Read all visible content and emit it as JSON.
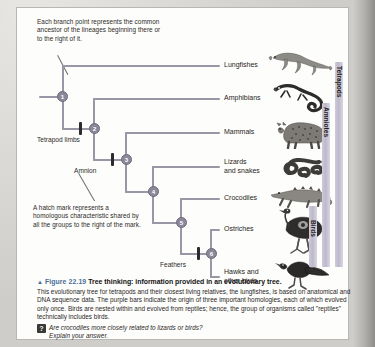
{
  "figure": {
    "triangle_icon": "▲",
    "number": "Figure 22.19",
    "title": "Tree thinking: information provided in an evolutionary tree.",
    "body": "This evolutionary tree for tetrapods and their closest living relatives, the lungfishes, is based on anatomical and DNA sequence data. The purple bars indicate the origin of three important homologies, each of which evolved only once. Birds are nested within and evolved from reptiles; hence, the group of organisms called \"reptiles\" technically includes birds.",
    "question_icon": "?",
    "question": "Are crocodiles more closely related to lizards or birds?\nExplain your answer."
  },
  "annotations": [
    {
      "name": "branch-point-note",
      "text": "Each branch point represents the common ancestor of the lineages beginning there or to the right of it."
    },
    {
      "name": "hatch-mark-note",
      "text": "A hatch mark represents a homologous characteristic shared by all the groups to the right of the mark."
    }
  ],
  "tree": {
    "nodes": [
      {
        "id": "1",
        "label": "1"
      },
      {
        "id": "2",
        "label": "2"
      },
      {
        "id": "3",
        "label": "3"
      },
      {
        "id": "4",
        "label": "4"
      },
      {
        "id": "5",
        "label": "5"
      },
      {
        "id": "6",
        "label": "6"
      }
    ],
    "hatch_marks": [
      {
        "id": "tetrapod-limbs",
        "label": "Tetrapod limbs"
      },
      {
        "id": "amnion",
        "label": "Amnion"
      },
      {
        "id": "feathers",
        "label": "Feathers"
      }
    ],
    "taxa": [
      {
        "id": "lungfishes",
        "label": "Lungfishes",
        "animal": "lungfish-illustration"
      },
      {
        "id": "amphibians",
        "label": "Amphibians",
        "animal": "salamander-illustration"
      },
      {
        "id": "mammals",
        "label": "Mammals",
        "animal": "leopard-illustration"
      },
      {
        "id": "lizards-and-snakes",
        "label": "Lizards\nand snakes",
        "animal": "snake-illustration"
      },
      {
        "id": "crocodiles",
        "label": "Crocodiles",
        "animal": "crocodile-illustration"
      },
      {
        "id": "ostriches",
        "label": "Ostriches",
        "animal": "ostrich-illustration"
      },
      {
        "id": "hawks-and-other-birds",
        "label": "Hawks and\nother birds",
        "animal": "hawk-illustration"
      }
    ],
    "clades": [
      {
        "id": "tetrapods",
        "label": "Tetrapods"
      },
      {
        "id": "amniotes",
        "label": "Amniotes"
      },
      {
        "id": "birds",
        "label": "Birds"
      }
    ]
  },
  "colors": {
    "branch": "#9a96a6",
    "node": "#8c8799",
    "hatch": "#2b2a30",
    "clade_bar": "#bdb8cb",
    "figure_number": "#4a6f94"
  }
}
